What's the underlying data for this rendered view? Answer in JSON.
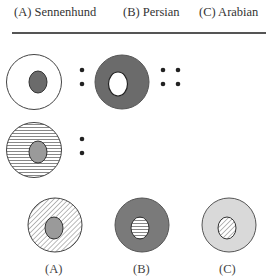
{
  "header": {
    "options": [
      {
        "label": "(A) Sennenhund"
      },
      {
        "label": "(B) Persian"
      },
      {
        "label": "(C) Arabian"
      }
    ]
  },
  "puzzle": {
    "row1": {
      "left_figure": "white-circle-with-dark-grey-oval",
      "relation": "colon",
      "right_figure": "dark-grey-circle-with-white-oval",
      "terminator": "double-colon"
    },
    "row2": {
      "left_figure": "horizontal-striped-circle-with-grey-oval",
      "relation": "colon"
    }
  },
  "answers": [
    {
      "label": "(A)",
      "outer": "diagonal-hatched",
      "inner": "grey"
    },
    {
      "label": "(B)",
      "outer": "dark-grey",
      "inner": "horizontal-striped"
    },
    {
      "label": "(C)",
      "outer": "light-grey",
      "inner": "diagonal-hatched"
    }
  ],
  "colors": {
    "dark_grey": "#6b6b6b",
    "mid_grey": "#9a9a9a",
    "light_grey": "#d9d9d9",
    "stroke": "#333333"
  }
}
